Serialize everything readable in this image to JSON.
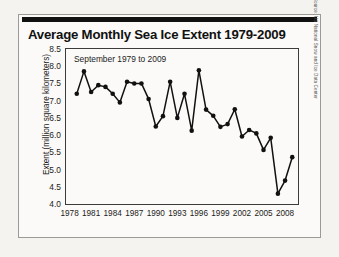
{
  "card": {
    "title": "Average Monthly Sea Ice Extent 1979-2009",
    "source": "Source: US National Snow and Ice Data Center"
  },
  "chart_data": {
    "type": "line",
    "title": "Average Monthly Sea Ice Extent 1979-2009",
    "subtitle": "September 1979 to 2009",
    "xlabel": "",
    "ylabel": "Extent (million square kilometers)",
    "xlim": [
      1977.5,
      2009.8
    ],
    "ylim": [
      4.0,
      8.5
    ],
    "yticks": [
      "8.5",
      "8.0",
      "7.5",
      "7.0",
      "6.5",
      "6.0",
      "5.5",
      "5.0",
      "4.5",
      "4.0"
    ],
    "ytick_values": [
      8.5,
      8.0,
      7.5,
      7.0,
      6.5,
      6.0,
      5.5,
      5.0,
      4.5,
      4.0
    ],
    "xticks": [
      "1978",
      "1981",
      "1984",
      "1987",
      "1990",
      "1993",
      "1996",
      "1999",
      "2002",
      "2005",
      "2008"
    ],
    "xtick_values": [
      1978,
      1981,
      1984,
      1987,
      1990,
      1993,
      1996,
      1999,
      2002,
      2005,
      2008
    ],
    "grid": false,
    "legend": "none",
    "marker": "filled-circle",
    "line_color": "#111111",
    "x": [
      1979,
      1980,
      1981,
      1982,
      1983,
      1984,
      1985,
      1986,
      1987,
      1988,
      1989,
      1990,
      1991,
      1992,
      1993,
      1994,
      1995,
      1996,
      1997,
      1998,
      1999,
      2000,
      2001,
      2002,
      2003,
      2004,
      2005,
      2006,
      2007,
      2008,
      2009
    ],
    "values": [
      7.2,
      7.85,
      7.25,
      7.45,
      7.4,
      7.2,
      6.95,
      7.55,
      7.5,
      7.5,
      7.05,
      6.25,
      6.55,
      7.55,
      6.5,
      7.2,
      6.13,
      7.88,
      6.74,
      6.56,
      6.24,
      6.32,
      6.75,
      5.96,
      6.15,
      6.05,
      5.57,
      5.92,
      4.3,
      4.68,
      5.36
    ],
    "units": "million square kilometers"
  }
}
